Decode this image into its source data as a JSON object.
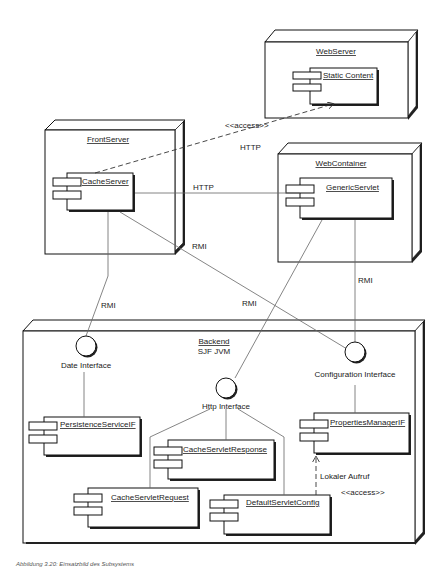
{
  "diagram": {
    "type": "uml-deployment",
    "nodes": {
      "webserver": {
        "title": "WebServer",
        "components": [
          "Static Content"
        ]
      },
      "frontserver": {
        "title": "FrontServer",
        "components": [
          "CacheServer"
        ]
      },
      "webcontainer": {
        "title": "WebContainer",
        "components": [
          "GenericServlet"
        ]
      },
      "backend": {
        "title": "Backend",
        "subtitle": "SJF JVM",
        "components": [
          "PersistenceServiceIF",
          "CacheServletResponse",
          "CacheServletRequest",
          "DefaultServletConfig",
          "PropertiesManagerIF"
        ]
      }
    },
    "interfaces": {
      "date": "Date Interface",
      "http": "Http Interface",
      "config": "Configuration Interface"
    },
    "edges": {
      "access_stereotype": "<<access>>",
      "http_dashed": "HTTP",
      "http_solid": "HTTP",
      "rmi_front_config": "RMI",
      "rmi_front_date": "RMI",
      "rmi_web_http": "RMI",
      "rmi_web_config": "RMI",
      "local_call": "Lokaler Aufruf",
      "local_access": "<<access>>"
    },
    "caption": "Abbildung 3.20: Einsatzbild des Subsystems"
  }
}
